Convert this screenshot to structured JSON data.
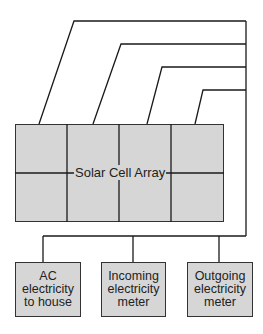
{
  "diagram": {
    "array_label": "Solar Cell Array",
    "boxes": [
      {
        "label_lines": [
          "AC",
          "electricity",
          "to house"
        ]
      },
      {
        "label_lines": [
          "Incoming",
          "electricity",
          "meter"
        ]
      },
      {
        "label_lines": [
          "Outgoing",
          "electricity",
          "meter"
        ]
      }
    ],
    "colors": {
      "fill": "#d6d6d6",
      "stroke": "#1a1a1a"
    }
  }
}
